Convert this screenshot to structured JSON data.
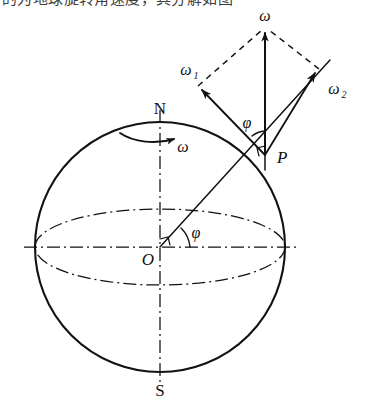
{
  "figure": {
    "caption_fragment": "的为地球旋转角速度，其分解如图"
  },
  "labels": {
    "north_pole": "N",
    "south_pole": "S",
    "center": "O",
    "point_p": "P",
    "omega_resultant": "ω",
    "omega_arc": "ω",
    "omega_1": "ω",
    "omega_1_sub": "1",
    "omega_2": "ω",
    "omega_2_sub": "2",
    "phi_at_p": "φ",
    "phi_at_o": "φ"
  },
  "geometry": {
    "sphere": {
      "cx": 160,
      "cy": 247,
      "r": 125
    },
    "equator": {
      "cx": 160,
      "cy": 247,
      "rx": 125,
      "ry": 38
    },
    "north_pole_point": {
      "x": 160,
      "y": 122
    },
    "south_pole_point": {
      "x": 160,
      "y": 372
    },
    "point_p": {
      "x": 267,
      "y": 155
    },
    "omega_apex": {
      "x": 265,
      "y": 30
    },
    "omega_1_tip": {
      "x": 200,
      "y": 88
    },
    "omega_2_tip": {
      "x": 317,
      "y": 71
    },
    "polar_axis": {
      "x": 160,
      "y_top": 110,
      "y_bottom": 385
    }
  },
  "colors": {
    "ink": "#111111",
    "background": "#ffffff"
  }
}
